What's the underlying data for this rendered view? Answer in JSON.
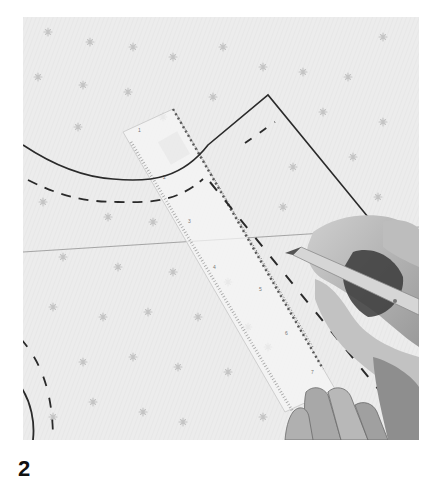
{
  "image": {
    "description": "Black-and-white photo of a sewing pattern being drafted on star-printed fabric: a transparent ruler laid diagonally while a hand traces a line with a pencil",
    "colors": {
      "fabric": "#ececec",
      "fabric_star": "#c4c4c4",
      "pattern_line": "#2a2a2a",
      "ruler": "#f4f4f4",
      "ruler_marks": "#555555",
      "skin_light": "#c9c9c9",
      "skin_dark": "#7a7a7a",
      "shadow": "#3a3a3a",
      "pencil": "#d6d6d6",
      "page_bg": "#ffffff"
    },
    "elements": [
      "solid-curved-neckline",
      "dashed-seam-allowance",
      "solid-shoulder-angle",
      "transparent-ruler",
      "hand-with-pencil",
      "supporting-fingers",
      "bottom-left-arcs"
    ]
  },
  "caption": {
    "step_number": "2"
  }
}
